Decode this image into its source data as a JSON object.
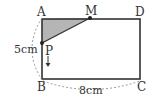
{
  "diagram": {
    "type": "geometry-rectangle",
    "vertices": {
      "A": "A",
      "B": "B",
      "C": "C",
      "D": "D"
    },
    "points": {
      "M": "M",
      "P": "P"
    },
    "dimensions": {
      "height": "5cm",
      "width": "8cm"
    },
    "shaded_region": "triangle AMP",
    "motion": "P moves downward along AB",
    "colors": {
      "shade": "#b5b5b5",
      "line": "#333333",
      "dashed": "#999999"
    }
  }
}
